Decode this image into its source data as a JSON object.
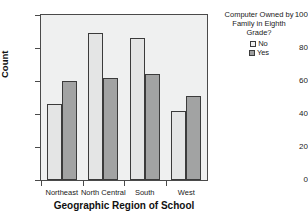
{
  "chart_data": {
    "type": "bar",
    "title": "",
    "xlabel": "Geographic Region of School",
    "ylabel": "Count",
    "categories": [
      "Northeast",
      "North Central",
      "South",
      "West"
    ],
    "series": [
      {
        "name": "No",
        "values": [
          46,
          89,
          86,
          42
        ]
      },
      {
        "name": "Yes",
        "values": [
          60,
          62,
          64,
          51
        ]
      }
    ],
    "ylim": [
      0,
      100
    ],
    "yticks": [
      0,
      20,
      40,
      60,
      80,
      100
    ],
    "grid": false,
    "legend": {
      "title": "Computer Owned by\nFamily in Eighth\nGrade?",
      "position": "right",
      "entries": [
        "No",
        "Yes"
      ]
    },
    "colors": {
      "no": "#e4e5e5",
      "yes": "#a2a3a3",
      "bar_border": "#3b3b3b",
      "plot_background": "#eff0f0",
      "axis": "#4a4a4a"
    }
  }
}
